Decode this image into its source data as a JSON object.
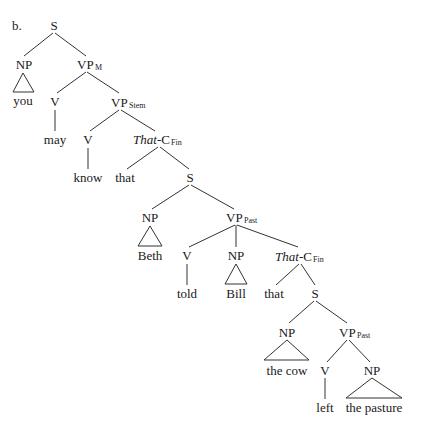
{
  "example_label": "b.",
  "tree": {
    "root": {
      "label": "S"
    },
    "np_subject": {
      "label": "NP",
      "leaf": "you"
    },
    "vp_m": {
      "label": "VP",
      "sub": "M"
    },
    "v_may": {
      "label": "V",
      "leaf": "may"
    },
    "vp_stem": {
      "label": "VP",
      "sub": "Stem"
    },
    "v_know": {
      "label": "V",
      "leaf": "know"
    },
    "that_c1": {
      "italic": "That",
      "label": "-C",
      "sub": "Fin",
      "leaf": "that"
    },
    "s2": {
      "label": "S"
    },
    "np_beth": {
      "label": "NP",
      "leaf": "Beth"
    },
    "vp_past1": {
      "label": "VP",
      "sub": "Past"
    },
    "v_told": {
      "label": "V",
      "leaf": "told"
    },
    "np_bill": {
      "label": "NP",
      "leaf": "Bill"
    },
    "that_c2": {
      "italic": "That",
      "label": "-C",
      "sub": "Fin",
      "leaf": "that"
    },
    "s3": {
      "label": "S"
    },
    "np_cow": {
      "label": "NP",
      "leaf": "the cow"
    },
    "vp_past2": {
      "label": "VP",
      "sub": "Past"
    },
    "v_left": {
      "label": "V",
      "leaf": "left"
    },
    "np_pasture": {
      "label": "NP",
      "leaf": "the pasture"
    }
  },
  "colors": {
    "ink": "#1a1a1a",
    "lines": "#333333",
    "background": "#ffffff"
  }
}
